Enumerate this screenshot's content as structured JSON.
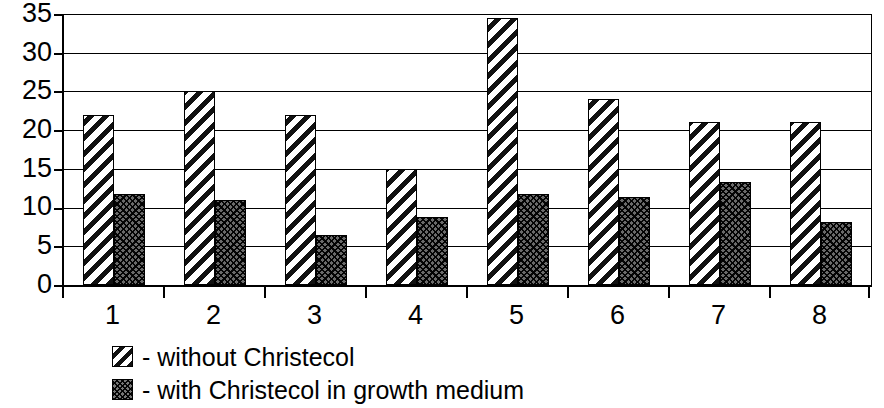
{
  "chart_data": {
    "type": "bar",
    "title": "",
    "subtitle": "",
    "xlabel": "",
    "ylabel": "",
    "categories": [
      "1",
      "2",
      "3",
      "4",
      "5",
      "6",
      "7",
      "8"
    ],
    "series": [
      {
        "name": "- without Christecol",
        "pattern": "diagonal-hatch",
        "values": [
          22,
          25,
          22,
          15,
          34.5,
          24,
          21,
          21
        ]
      },
      {
        "name": "- with Christecol in growth medium",
        "pattern": "dotted-crosshatch",
        "values": [
          11.7,
          11,
          6.5,
          8.8,
          11.7,
          11.4,
          13.3,
          8.2
        ]
      }
    ],
    "ylim": [
      0,
      35
    ],
    "yticks": [
      0,
      5,
      10,
      15,
      20,
      25,
      30,
      35
    ],
    "ytick_labels": [
      "0",
      "5",
      "10",
      "15",
      "20",
      "25",
      "30",
      "35"
    ],
    "grid": true,
    "grid_axis": "y",
    "legend_position": "bottom-left",
    "colors": {
      "series_1_fill": "#ffffff",
      "series_1_stripe": "#111111",
      "series_2_fill": "#6a6a6a",
      "series_2_dot": "#000000",
      "axis": "#000000",
      "grid": "#000000",
      "background": "#ffffff"
    }
  },
  "legend": {
    "items": [
      {
        "swatch": "diagonal-hatch-swatch",
        "label": "- without Christecol"
      },
      {
        "swatch": "dotted-crosshatch-swatch",
        "label": "- with Christecol in growth medium"
      }
    ]
  }
}
